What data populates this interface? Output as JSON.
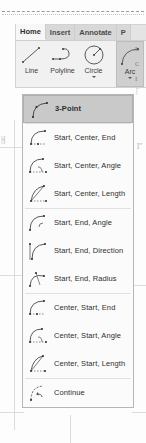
{
  "app": {
    "background_guides": {
      "top_rule_label": "dashed-section-line",
      "left_dimension_mark": "|-||"
    }
  },
  "ribbon": {
    "tabs": [
      {
        "label": "Home",
        "active": true
      },
      {
        "label": "Insert",
        "active": false
      },
      {
        "label": "Annotate",
        "active": false
      },
      {
        "label": "P",
        "active": false
      }
    ],
    "draw_panel": {
      "tools": [
        {
          "label": "Line",
          "icon": "line-icon",
          "has_caret": false,
          "selected": false
        },
        {
          "label": "Polyline",
          "icon": "polyline-icon",
          "has_caret": false,
          "selected": false
        },
        {
          "label": "Circle",
          "icon": "circle-icon",
          "has_caret": true,
          "selected": false
        },
        {
          "label": "Arc",
          "icon": "arc-icon",
          "has_caret": true,
          "selected": true
        }
      ],
      "clipped_edge_glyphs": [
        "L",
        "C",
        "I"
      ]
    }
  },
  "arc_flyout": {
    "items": [
      {
        "label": "3-Point",
        "icon": "arc-3-point-icon",
        "highlighted": true,
        "separator_after": true
      },
      {
        "label": "Start, Center, End",
        "icon": "arc-start-center-end-icon",
        "highlighted": false,
        "separator_after": false
      },
      {
        "label": "Start, Center, Angle",
        "icon": "arc-start-center-angle-icon",
        "highlighted": false,
        "separator_after": false
      },
      {
        "label": "Start, Center, Length",
        "icon": "arc-start-center-length-icon",
        "highlighted": false,
        "separator_after": true
      },
      {
        "label": "Start, End, Angle",
        "icon": "arc-start-end-angle-icon",
        "highlighted": false,
        "separator_after": false
      },
      {
        "label": "Start, End, Direction",
        "icon": "arc-start-end-direction-icon",
        "highlighted": false,
        "separator_after": false
      },
      {
        "label": "Start, End, Radius",
        "icon": "arc-start-end-radius-icon",
        "highlighted": false,
        "separator_after": true
      },
      {
        "label": "Center, Start, End",
        "icon": "arc-center-start-end-icon",
        "highlighted": false,
        "separator_after": false
      },
      {
        "label": "Center, Start, Angle",
        "icon": "arc-center-start-angle-icon",
        "highlighted": false,
        "separator_after": false
      },
      {
        "label": "Center, Start, Length",
        "icon": "arc-center-start-length-icon",
        "highlighted": false,
        "separator_after": true
      },
      {
        "label": "Continue",
        "icon": "arc-continue-icon",
        "highlighted": false,
        "separator_after": false
      }
    ]
  },
  "colors": {
    "ribbon_bg": "#e8e8e8",
    "panel_bg": "#f1f1f1",
    "tab_active_bg": "#f7f7f7",
    "selection_bg": "#c9c9c9",
    "menu_bg": "#fbfbfb",
    "menu_border": "#b6b6b6",
    "text": "#2e2e2e",
    "icon_stroke": "#5a5a5a",
    "guide": "#dcdcdc"
  }
}
